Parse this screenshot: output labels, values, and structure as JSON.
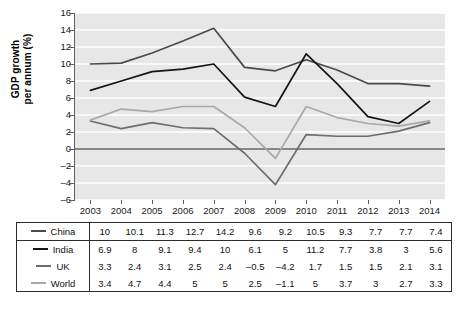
{
  "chart_data": {
    "type": "line",
    "title": "",
    "xlabel": "",
    "ylabel": "GDP growth per annum (%)",
    "ylabel_line1": "GDP growth",
    "ylabel_line2": "per annum (%)",
    "categories": [
      "2003",
      "2004",
      "2005",
      "2006",
      "2007",
      "2008",
      "2009",
      "2010",
      "2011",
      "2012",
      "2013",
      "2014"
    ],
    "ylim": [
      -6,
      16
    ],
    "yticks": [
      16,
      14,
      12,
      10,
      8,
      6,
      4,
      2,
      0,
      -2,
      -4,
      -6
    ],
    "ytick_labels": [
      "16",
      "14",
      "12",
      "10",
      "8",
      "6",
      "4",
      "2",
      "0",
      "–2",
      "–4",
      "–6"
    ],
    "grid": "horizontal-white-gridlines",
    "zero_line": true,
    "legend_position": "table-below",
    "plot_background": "#e7e7e7",
    "series": [
      {
        "name": "China",
        "color": "#4a4a4a",
        "values": [
          10,
          10.1,
          11.3,
          12.7,
          14.2,
          9.6,
          9.2,
          10.5,
          9.3,
          7.7,
          7.7,
          7.4
        ],
        "labels": [
          "10",
          "10.1",
          "11.3",
          "12.7",
          "14.2",
          "9.6",
          "9.2",
          "10.5",
          "9.3",
          "7.7",
          "7.7",
          "7.4"
        ]
      },
      {
        "name": "India",
        "color": "#151515",
        "values": [
          6.9,
          8,
          9.1,
          9.4,
          10,
          6.1,
          5,
          11.2,
          7.7,
          3.8,
          3,
          5.6
        ],
        "labels": [
          "6.9",
          "8",
          "9.1",
          "9.4",
          "10",
          "6.1",
          "5",
          "11.2",
          "7.7",
          "3.8",
          "3",
          "5.6"
        ]
      },
      {
        "name": "UK",
        "color": "#6e6e6e",
        "values": [
          3.3,
          2.4,
          3.1,
          2.5,
          2.4,
          -0.5,
          -4.2,
          1.7,
          1.5,
          1.5,
          2.1,
          3.1
        ],
        "labels": [
          "3.3",
          "2.4",
          "3.1",
          "2.5",
          "2.4",
          "–0.5",
          "–4.2",
          "1.7",
          "1.5",
          "1.5",
          "2.1",
          "3.1"
        ]
      },
      {
        "name": "World",
        "color": "#a9a9a9",
        "values": [
          3.4,
          4.7,
          4.4,
          5,
          5,
          2.5,
          -1.1,
          5,
          3.7,
          3,
          2.7,
          3.3
        ],
        "labels": [
          "3.4",
          "4.7",
          "4.4",
          "5",
          "5",
          "2.5",
          "–1.1",
          "5",
          "3.7",
          "3",
          "2.7",
          "3.3"
        ]
      }
    ]
  }
}
